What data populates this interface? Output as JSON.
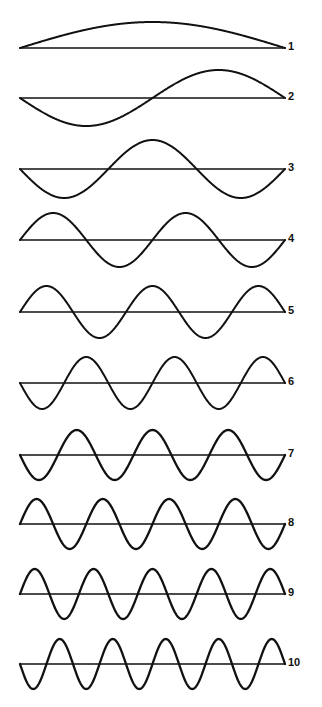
{
  "figure": {
    "name": "harmonic-standing-waves",
    "background_color": "#ffffff",
    "stroke_color": "#111111",
    "label_color": "#111111"
  },
  "chart_data": {
    "type": "line",
    "title": "",
    "subtitle": "",
    "xlabel": "",
    "ylabel": "",
    "grid": false,
    "legend_position": "right",
    "axis_style": "baseline-only",
    "x_start_px": 20,
    "x_end_px": 285,
    "xlim": [
      0,
      1
    ],
    "ylim": [
      -1,
      1
    ],
    "series": [
      {
        "name": "1",
        "label": "1",
        "harmonic": 1,
        "cycles": 0.5,
        "half_wavelengths": 1,
        "start_direction": "up",
        "phase_sign": 1,
        "amplitude_px": 26,
        "baseline_y_px": 48,
        "label_x_px": 288,
        "label_y_px": 41
      },
      {
        "name": "2",
        "label": "2",
        "harmonic": 2,
        "cycles": 1,
        "half_wavelengths": 2,
        "start_direction": "down",
        "phase_sign": -1,
        "amplitude_px": 28,
        "baseline_y_px": 98,
        "label_x_px": 288,
        "label_y_px": 91
      },
      {
        "name": "3",
        "label": "3",
        "harmonic": 3,
        "cycles": 1.5,
        "half_wavelengths": 3,
        "start_direction": "down",
        "phase_sign": -1,
        "amplitude_px": 29,
        "baseline_y_px": 169,
        "label_x_px": 288,
        "label_y_px": 162
      },
      {
        "name": "4",
        "label": "4",
        "harmonic": 4,
        "cycles": 2,
        "half_wavelengths": 4,
        "start_direction": "up",
        "phase_sign": 1,
        "amplitude_px": 27,
        "baseline_y_px": 240,
        "label_x_px": 288,
        "label_y_px": 233
      },
      {
        "name": "5",
        "label": "5",
        "harmonic": 5,
        "cycles": 2.5,
        "half_wavelengths": 5,
        "start_direction": "up",
        "phase_sign": 1,
        "amplitude_px": 26,
        "baseline_y_px": 312,
        "label_x_px": 288,
        "label_y_px": 305
      },
      {
        "name": "6",
        "label": "6",
        "harmonic": 6,
        "cycles": 3,
        "half_wavelengths": 6,
        "start_direction": "down",
        "phase_sign": -1,
        "amplitude_px": 26,
        "baseline_y_px": 383,
        "label_x_px": 288,
        "label_y_px": 376
      },
      {
        "name": "7",
        "label": "7",
        "harmonic": 7,
        "cycles": 3.5,
        "half_wavelengths": 7,
        "start_direction": "down",
        "phase_sign": -1,
        "amplitude_px": 25,
        "baseline_y_px": 455,
        "label_x_px": 288,
        "label_y_px": 448
      },
      {
        "name": "8",
        "label": "8",
        "harmonic": 8,
        "cycles": 4,
        "half_wavelengths": 8,
        "start_direction": "up",
        "phase_sign": 1,
        "amplitude_px": 25,
        "baseline_y_px": 524,
        "label_x_px": 288,
        "label_y_px": 517
      },
      {
        "name": "9",
        "label": "9",
        "harmonic": 9,
        "cycles": 4.5,
        "half_wavelengths": 9,
        "start_direction": "up",
        "phase_sign": 1,
        "amplitude_px": 25,
        "baseline_y_px": 594,
        "label_x_px": 288,
        "label_y_px": 587
      },
      {
        "name": "10",
        "label": "10",
        "harmonic": 10,
        "cycles": 5,
        "half_wavelengths": 10,
        "start_direction": "down",
        "phase_sign": -1,
        "amplitude_px": 25,
        "baseline_y_px": 664,
        "label_x_px": 288,
        "label_y_px": 657
      }
    ]
  }
}
